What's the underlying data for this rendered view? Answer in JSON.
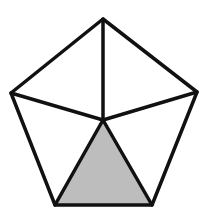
{
  "diagram": {
    "colors": {
      "stroke": "#111111",
      "shade": "#bdbdbd",
      "background": "#ffffff"
    },
    "vertices": {
      "top": [
        103,
        19
      ],
      "right": [
        197,
        92
      ],
      "bottom_right": [
        152,
        205
      ],
      "bottom_left": [
        55,
        205
      ],
      "left": [
        11,
        93
      ],
      "center": [
        103,
        120
      ]
    },
    "shaded_triangle": [
      "center",
      "bottom_right",
      "bottom_left"
    ]
  }
}
